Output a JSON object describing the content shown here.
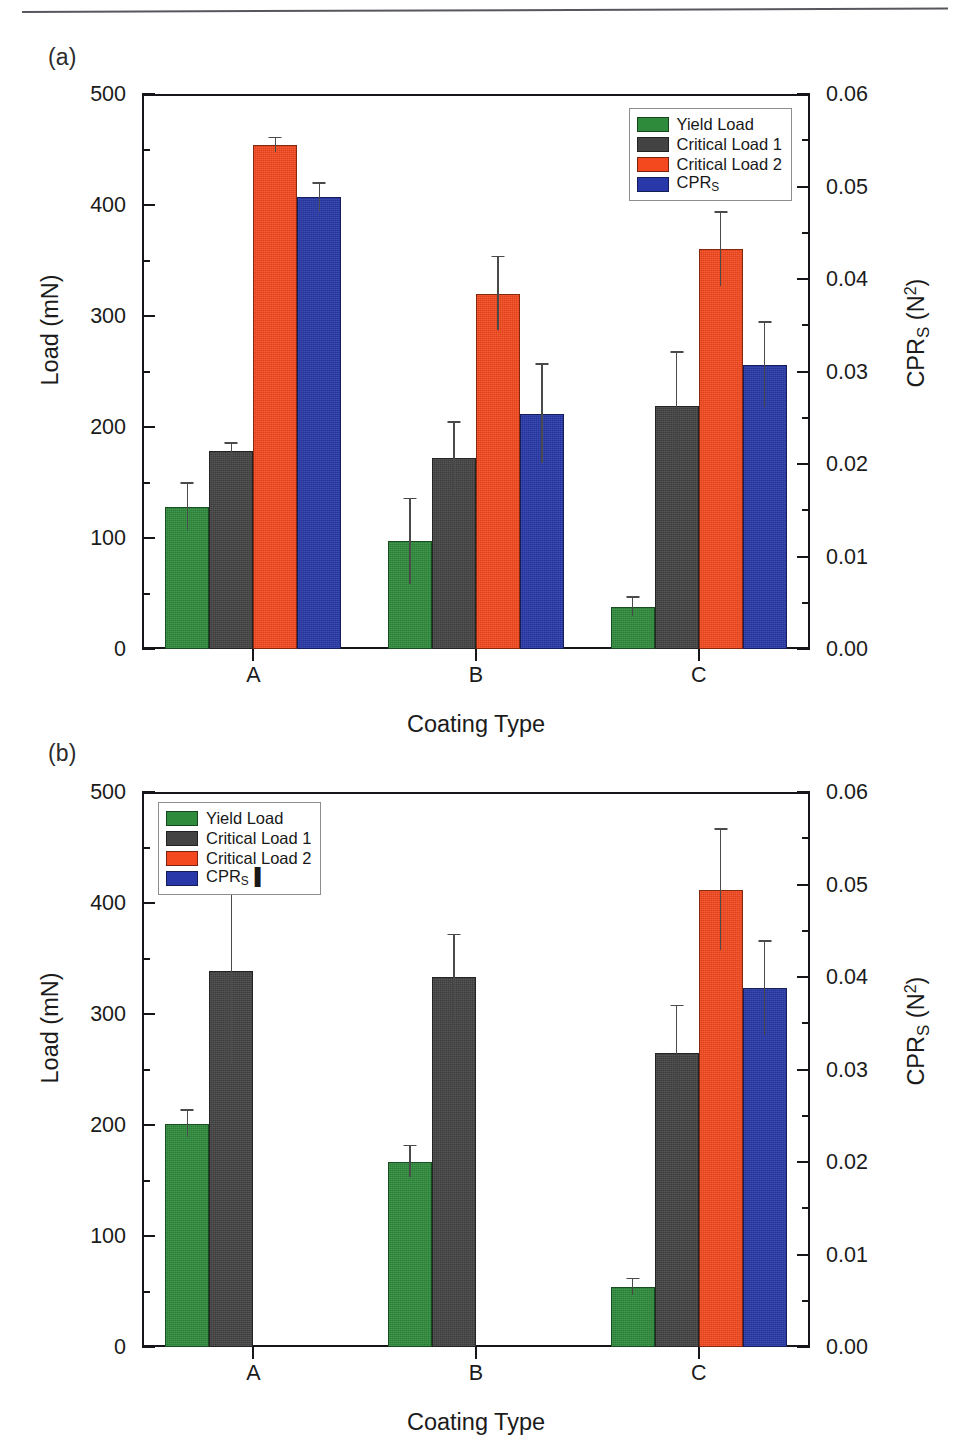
{
  "figure": {
    "panels": [
      {
        "id": "a",
        "label": "(a)",
        "legend_position": "top-right",
        "legend": [
          {
            "label": "Yield Load",
            "color": "#2E8B3C"
          },
          {
            "label": "Critical Load 1",
            "color": "#434343"
          },
          {
            "label": "Critical Load 2",
            "color": "#F4491E"
          },
          {
            "label": "CPR",
            "sub": "S",
            "color": "#2838A8"
          }
        ]
      },
      {
        "id": "b",
        "label": "(b)",
        "legend_position": "top-left",
        "legend": [
          {
            "label": "Yield Load",
            "color": "#2E8B3C"
          },
          {
            "label": "Critical Load 1",
            "color": "#434343"
          },
          {
            "label": "Critical Load 2",
            "color": "#F4491E"
          },
          {
            "label": "CPR",
            "sub": "S",
            "trail": "▐",
            "color": "#2838A8"
          }
        ]
      }
    ]
  },
  "axes": {
    "y_left_title_main": "Load (mN)",
    "y_right_title_main": "CPR",
    "y_right_title_sub": "S",
    "y_right_title_unit_base": " (N",
    "y_right_title_unit_sup": "2",
    "y_right_title_unit_close": ")",
    "x_title": "Coating Type",
    "y_left_ticks": [
      "0",
      "100",
      "200",
      "300",
      "400",
      "500"
    ],
    "y_right_ticks": [
      "0.00",
      "0.01",
      "0.02",
      "0.03",
      "0.04",
      "0.05",
      "0.06"
    ],
    "x_categories": [
      "A",
      "B",
      "C"
    ]
  },
  "chart_data": [
    {
      "type": "bar",
      "panel": "a",
      "title": "(a)",
      "xlabel": "Coating Type",
      "ylabel": "Load (mN)",
      "ylabel_secondary": "CPR_S (N^2)",
      "categories": [
        "A",
        "B",
        "C"
      ],
      "ylim": [
        0,
        500
      ],
      "ylim_secondary": [
        0.0,
        0.06
      ],
      "grid": false,
      "legend_position": "upper right",
      "series": [
        {
          "name": "Yield Load",
          "axis": "left",
          "unit": "mN",
          "color": "#2E8B3C",
          "values": [
            128,
            97,
            38
          ],
          "errors": [
            21,
            38,
            8
          ]
        },
        {
          "name": "Critical Load 1",
          "axis": "left",
          "unit": "mN",
          "color": "#434343",
          "values": [
            178,
            172,
            219
          ],
          "errors": [
            7,
            32,
            48
          ]
        },
        {
          "name": "Critical Load 2",
          "axis": "left",
          "unit": "mN",
          "color": "#F4491E",
          "values": [
            454,
            320,
            360
          ],
          "errors": [
            6,
            33,
            33
          ]
        },
        {
          "name": "CPR_S",
          "axis": "right",
          "unit": "N^2",
          "color": "#2838A8",
          "values_secondary": [
            0.0488,
            0.0254,
            0.0307
          ],
          "values": [
            407,
            212,
            256
          ],
          "errors": [
            12,
            44,
            38
          ]
        }
      ]
    },
    {
      "type": "bar",
      "panel": "b",
      "title": "(b)",
      "xlabel": "Coating Type",
      "ylabel": "Load (mN)",
      "ylabel_secondary": "CPR_S (N^2)",
      "categories": [
        "A",
        "B",
        "C"
      ],
      "ylim": [
        0,
        500
      ],
      "ylim_secondary": [
        0.0,
        0.06
      ],
      "grid": false,
      "legend_position": "upper left",
      "series": [
        {
          "name": "Yield Load",
          "axis": "left",
          "unit": "mN",
          "color": "#2E8B3C",
          "values": [
            201,
            167,
            54
          ],
          "errors": [
            12,
            14,
            7
          ]
        },
        {
          "name": "Critical Load 1",
          "axis": "left",
          "unit": "mN",
          "color": "#434343",
          "values": [
            339,
            333,
            265
          ],
          "errors": [
            84,
            38,
            42
          ]
        },
        {
          "name": "Critical Load 2",
          "axis": "left",
          "unit": "mN",
          "color": "#F4491E",
          "values": [
            null,
            null,
            412
          ],
          "errors": [
            null,
            null,
            54
          ]
        },
        {
          "name": "CPR_S",
          "axis": "right",
          "unit": "N^2",
          "color": "#2838A8",
          "values_secondary": [
            null,
            null,
            0.0387
          ],
          "values": [
            null,
            null,
            323
          ],
          "errors": [
            null,
            null,
            42
          ]
        }
      ]
    }
  ]
}
